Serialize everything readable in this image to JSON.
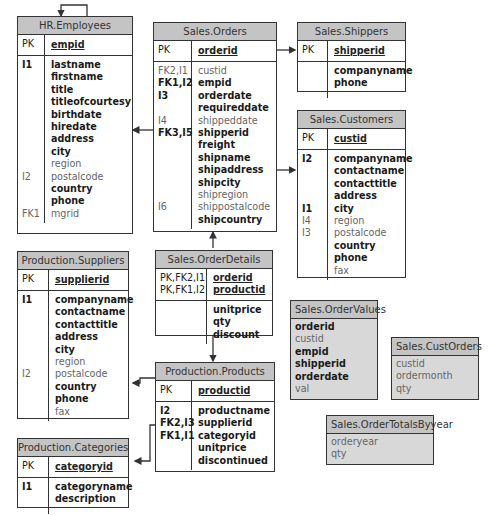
{
  "tables": {
    "employees": {
      "title": "HR.Employees",
      "pk_label": "PK",
      "pk_col": "empid",
      "keys": [
        "I1",
        "",
        "",
        "",
        "",
        "",
        "",
        "",
        "",
        "I2",
        "",
        "",
        "FK1"
      ],
      "columns": [
        {
          "name": "lastname",
          "bold": true
        },
        {
          "name": "firstname",
          "bold": true
        },
        {
          "name": "title",
          "bold": true
        },
        {
          "name": "titleofcourtesy",
          "bold": true
        },
        {
          "name": "birthdate",
          "bold": true
        },
        {
          "name": "hiredate",
          "bold": true
        },
        {
          "name": "address",
          "bold": true
        },
        {
          "name": "city",
          "bold": true
        },
        {
          "name": "region",
          "bold": false
        },
        {
          "name": "postalcode",
          "bold": false
        },
        {
          "name": "country",
          "bold": true
        },
        {
          "name": "phone",
          "bold": true
        },
        {
          "name": "mgrid",
          "bold": false
        }
      ]
    },
    "orders": {
      "title": "Sales.Orders",
      "pk_label": "PK",
      "pk_col": "orderid",
      "keys": [
        "FK2,I1",
        "FK1,I2",
        "I3",
        "",
        "I4",
        "FK3,I5",
        "",
        "",
        "",
        "",
        "",
        "I6",
        ""
      ],
      "columns": [
        {
          "name": "custid",
          "bold": false
        },
        {
          "name": "empid",
          "bold": true
        },
        {
          "name": "orderdate",
          "bold": true
        },
        {
          "name": "requireddate",
          "bold": true
        },
        {
          "name": "shippeddate",
          "bold": false
        },
        {
          "name": "shipperid",
          "bold": true
        },
        {
          "name": "freight",
          "bold": true
        },
        {
          "name": "shipname",
          "bold": true
        },
        {
          "name": "shipaddress",
          "bold": true
        },
        {
          "name": "shipcity",
          "bold": true
        },
        {
          "name": "shipregion",
          "bold": false
        },
        {
          "name": "shippostalcode",
          "bold": false
        },
        {
          "name": "shipcountry",
          "bold": true
        }
      ]
    },
    "shippers": {
      "title": "Sales.Shippers",
      "pk_label": "PK",
      "pk_col": "shipperid",
      "keys": [
        "",
        ""
      ],
      "columns": [
        {
          "name": "companyname",
          "bold": true
        },
        {
          "name": "phone",
          "bold": true
        }
      ]
    },
    "customers": {
      "title": "Sales.Customers",
      "pk_label": "PK",
      "pk_col": "custid",
      "keys": [
        "I2",
        "",
        "",
        "",
        "I1",
        "I4",
        "I3",
        "",
        "",
        ""
      ],
      "columns": [
        {
          "name": "companyname",
          "bold": true
        },
        {
          "name": "contactname",
          "bold": true
        },
        {
          "name": "contacttitle",
          "bold": true
        },
        {
          "name": "address",
          "bold": true
        },
        {
          "name": "city",
          "bold": true
        },
        {
          "name": "region",
          "bold": false
        },
        {
          "name": "postalcode",
          "bold": false
        },
        {
          "name": "country",
          "bold": true
        },
        {
          "name": "phone",
          "bold": true
        },
        {
          "name": "fax",
          "bold": false
        }
      ]
    },
    "suppliers": {
      "title": "Production.Suppliers",
      "pk_label": "PK",
      "pk_col": "supplierid",
      "keys": [
        "I1",
        "",
        "",
        "",
        "",
        "",
        "I2",
        "",
        "",
        ""
      ],
      "columns": [
        {
          "name": "companyname",
          "bold": true
        },
        {
          "name": "contactname",
          "bold": true
        },
        {
          "name": "contacttitle",
          "bold": true
        },
        {
          "name": "address",
          "bold": true
        },
        {
          "name": "city",
          "bold": true
        },
        {
          "name": "region",
          "bold": false
        },
        {
          "name": "postalcode",
          "bold": false
        },
        {
          "name": "country",
          "bold": true
        },
        {
          "name": "phone",
          "bold": true
        },
        {
          "name": "fax",
          "bold": false
        }
      ]
    },
    "orderdetails": {
      "title": "Sales.OrderDetails",
      "pk_keys": [
        "PK,FK2,I1",
        "PK,FK1,I2"
      ],
      "pk_cols": [
        "orderid",
        "productid"
      ],
      "keys": [
        "",
        "",
        ""
      ],
      "columns": [
        {
          "name": "unitprice",
          "bold": true
        },
        {
          "name": "qty",
          "bold": true
        },
        {
          "name": "discount",
          "bold": true
        }
      ]
    },
    "products": {
      "title": "Production.Products",
      "pk_label": "PK",
      "pk_col": "productid",
      "keys": [
        "I2",
        "FK2,I3",
        "FK1,I1",
        "",
        ""
      ],
      "columns": [
        {
          "name": "productname",
          "bold": true
        },
        {
          "name": "supplierid",
          "bold": true
        },
        {
          "name": "categoryid",
          "bold": true
        },
        {
          "name": "unitprice",
          "bold": true
        },
        {
          "name": "discontinued",
          "bold": true
        }
      ]
    },
    "categories": {
      "title": "Production.Categories",
      "pk_label": "PK",
      "pk_col": "categoryid",
      "keys": [
        "I1",
        ""
      ],
      "columns": [
        {
          "name": "categoryname",
          "bold": true
        },
        {
          "name": "description",
          "bold": true
        }
      ]
    }
  },
  "views": {
    "ordervalues": {
      "title": "Sales.OrderValues",
      "columns": [
        {
          "name": "orderid",
          "bold": true
        },
        {
          "name": "custid",
          "bold": false
        },
        {
          "name": "empid",
          "bold": true
        },
        {
          "name": "shipperid",
          "bold": true
        },
        {
          "name": "orderdate",
          "bold": true
        },
        {
          "name": "val",
          "bold": false
        }
      ]
    },
    "custorders": {
      "title": "Sales.CustOrders",
      "columns": [
        {
          "name": "custid",
          "bold": false
        },
        {
          "name": "ordermonth",
          "bold": false
        },
        {
          "name": "qty",
          "bold": false
        }
      ]
    },
    "ordertotals": {
      "title": "Sales.OrderTotalsByyear",
      "columns": [
        {
          "name": "orderyear",
          "bold": false
        },
        {
          "name": "qty",
          "bold": false
        }
      ]
    }
  },
  "colors": {
    "header_bg": "#c4c4c4",
    "view_bg": "#d8d8d8",
    "border": "#333333"
  }
}
